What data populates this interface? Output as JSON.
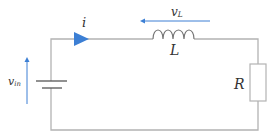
{
  "diagram": {
    "type": "circuit",
    "colors": {
      "wire": "#b3b3b3",
      "arrow": "#3c7fd4",
      "label": "#333333",
      "background": "#ffffff"
    },
    "components": [
      {
        "id": "source",
        "kind": "battery",
        "label": "v",
        "label_sub": "in"
      },
      {
        "id": "inductor",
        "kind": "inductor",
        "label": "L"
      },
      {
        "id": "resistor",
        "kind": "resistor",
        "label": "R"
      }
    ],
    "annotations": {
      "current": {
        "symbol": "i",
        "direction": "clockwise"
      },
      "inductor_voltage": {
        "symbol": "v",
        "sub": "L",
        "direction": "right-to-left"
      },
      "source_voltage": {
        "symbol": "v",
        "sub": "in",
        "direction": "upward"
      }
    }
  }
}
